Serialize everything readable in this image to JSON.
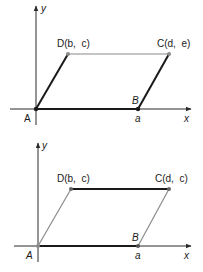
{
  "diagrams": [
    {
      "id": "top",
      "axis_labels": {
        "x": "x",
        "y": "y"
      },
      "points": {
        "A": {
          "label": "A"
        },
        "B": {
          "label": "B",
          "coord_label": "a"
        },
        "C": {
          "label": "C(d,  e)"
        },
        "D": {
          "label": "D(b,  c)"
        }
      },
      "bold_sides": [
        "AD",
        "BC",
        "AB"
      ],
      "thin_sides": [
        "DC"
      ]
    },
    {
      "id": "bottom",
      "axis_labels": {
        "x": "x",
        "y": "y"
      },
      "points": {
        "A": {
          "label": "A"
        },
        "B": {
          "label": "B",
          "coord_label": "a"
        },
        "C": {
          "label": "C(d,  c)"
        },
        "D": {
          "label": "D(b,  c)"
        }
      },
      "bold_sides": [
        "DC",
        "AB"
      ],
      "thin_sides": [
        "AD",
        "BC"
      ]
    }
  ],
  "colors": {
    "bold": "#1a1a1a",
    "thin": "#8a8a8a",
    "axis": "#2a2a2a"
  }
}
